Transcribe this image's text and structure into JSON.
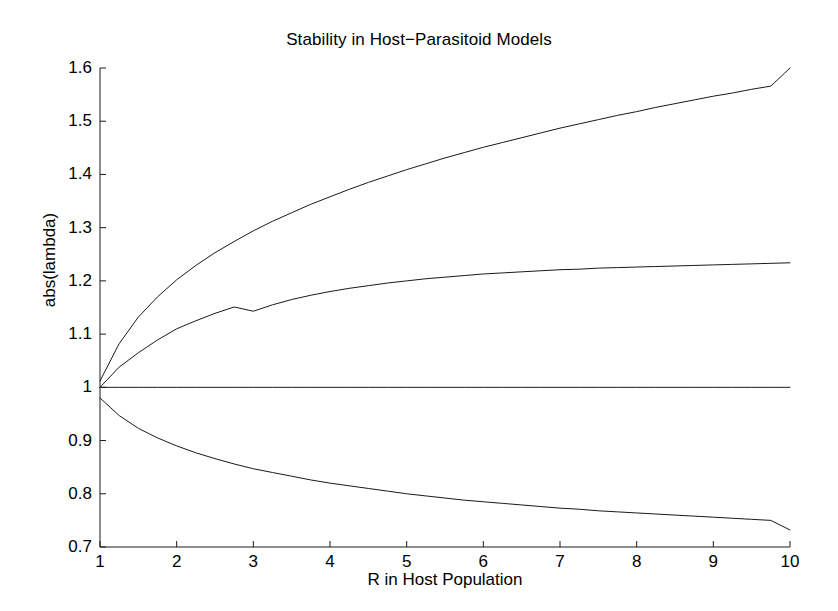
{
  "chart_data": {
    "type": "line",
    "title": "Stability in Host−Parasitoid Models",
    "xlabel": "R in Host Population",
    "ylabel": "abs(lambda)",
    "xlim": [
      1,
      10
    ],
    "ylim": [
      0.7,
      1.6
    ],
    "xticks": [
      1,
      2,
      3,
      4,
      5,
      6,
      7,
      8,
      9,
      10
    ],
    "xtick_labels": [
      "1",
      "2",
      "3",
      "4",
      "5",
      "6",
      "7",
      "8",
      "9",
      "10"
    ],
    "yticks": [
      0.7,
      0.8,
      0.9,
      1.0,
      1.1,
      1.2,
      1.3,
      1.4,
      1.5,
      1.6
    ],
    "ytick_labels": [
      "0.7",
      "0.8",
      "0.9",
      "1",
      "1.1",
      "1.2",
      "1.3",
      "1.4",
      "1.5",
      "1.6"
    ],
    "grid": false,
    "legend": "none",
    "line_color": "#1a1a1a",
    "line_width": 1,
    "background": "#ffffff",
    "x": [
      1,
      1.25,
      1.5,
      1.75,
      2,
      2.25,
      2.5,
      2.75,
      3,
      3.25,
      3.5,
      3.75,
      4,
      4.25,
      4.5,
      4.75,
      5,
      5.25,
      5.5,
      5.75,
      6,
      6.25,
      6.5,
      6.75,
      7,
      7.25,
      7.5,
      7.75,
      8,
      8.25,
      8.5,
      8.75,
      9,
      9.25,
      9.5,
      9.75,
      10
    ],
    "series": [
      {
        "name": "branch-1-upper",
        "values": [
          1.012,
          1.082,
          1.132,
          1.17,
          1.202,
          1.229,
          1.253,
          1.274,
          1.294,
          1.312,
          1.328,
          1.344,
          1.358,
          1.372,
          1.385,
          1.397,
          1.409,
          1.42,
          1.431,
          1.441,
          1.451,
          1.46,
          1.469,
          1.478,
          1.487,
          1.495,
          1.503,
          1.511,
          1.518,
          1.526,
          1.533,
          1.54,
          1.547,
          1.553,
          1.56,
          1.566,
          1.6
        ]
      },
      {
        "name": "branch-2-upper",
        "values": [
          1.0,
          1.038,
          1.065,
          1.089,
          1.11,
          1.125,
          1.139,
          1.151,
          1.143,
          1.155,
          1.165,
          1.173,
          1.18,
          1.186,
          1.191,
          1.196,
          1.2,
          1.204,
          1.207,
          1.21,
          1.213,
          1.215,
          1.217,
          1.219,
          1.221,
          1.222,
          1.224,
          1.225,
          1.226,
          1.227,
          1.228,
          1.229,
          1.23,
          1.231,
          1.232,
          1.233,
          1.234
        ]
      },
      {
        "name": "branch-3-unit",
        "values": [
          1.0,
          1.0,
          1.0,
          1.0,
          1.0,
          1.0,
          1.0,
          1.0,
          1.0,
          1.0,
          1.0,
          1.0,
          1.0,
          1.0,
          1.0,
          1.0,
          1.0,
          1.0,
          1.0,
          1.0,
          1.0,
          1.0,
          1.0,
          1.0,
          1.0,
          1.0,
          1.0,
          1.0,
          1.0,
          1.0,
          1.0,
          1.0,
          1.0,
          1.0,
          1.0,
          1.0,
          1.0
        ]
      },
      {
        "name": "branch-4-lower",
        "values": [
          0.98,
          0.947,
          0.923,
          0.905,
          0.89,
          0.877,
          0.866,
          0.856,
          0.847,
          0.84,
          0.833,
          0.826,
          0.82,
          0.815,
          0.81,
          0.805,
          0.8,
          0.796,
          0.792,
          0.788,
          0.785,
          0.782,
          0.779,
          0.776,
          0.773,
          0.771,
          0.768,
          0.766,
          0.764,
          0.762,
          0.76,
          0.758,
          0.756,
          0.754,
          0.752,
          0.75,
          0.732
        ]
      }
    ]
  },
  "figure": {
    "axis_color": "#1a1a1a",
    "tick_direction": "in"
  }
}
